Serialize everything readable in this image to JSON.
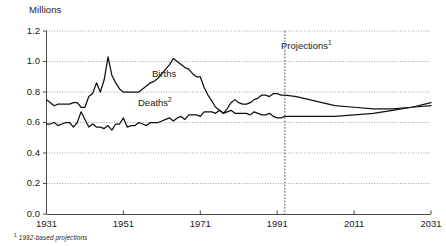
{
  "chart_data": {
    "type": "line",
    "title": "",
    "ylabel": "Millions",
    "xlabel": "",
    "ylim": [
      0.0,
      1.2
    ],
    "xlim": [
      1931,
      2031
    ],
    "yticks": [
      "0.0",
      "0.2",
      "0.4",
      "0.6",
      "0.8",
      "1.0",
      "1.2"
    ],
    "ytick_values": [
      0.0,
      0.2,
      0.4,
      0.6,
      0.8,
      1.0,
      1.2
    ],
    "xticks": [
      "1931",
      "1951",
      "1971",
      "1991",
      "2011",
      "2031"
    ],
    "xtick_values": [
      1931,
      1951,
      1971,
      1991,
      2011,
      2031
    ],
    "grid": "horizontal-dotted",
    "legend": "inline-labels",
    "annotations": [
      {
        "name": "projections-divider",
        "text": "Projections",
        "superscript": "1",
        "x": 1993,
        "style": "vertical-dotted-line"
      }
    ],
    "footnote": {
      "marker": "1",
      "text": "1992-based projections"
    },
    "series": [
      {
        "name": "Births",
        "label": "Births",
        "x": [
          1931,
          1932,
          1933,
          1934,
          1935,
          1936,
          1937,
          1938,
          1939,
          1940,
          1941,
          1942,
          1943,
          1944,
          1945,
          1946,
          1947,
          1948,
          1949,
          1950,
          1951,
          1952,
          1953,
          1954,
          1955,
          1956,
          1957,
          1958,
          1959,
          1960,
          1961,
          1962,
          1963,
          1964,
          1965,
          1966,
          1967,
          1968,
          1969,
          1970,
          1971,
          1972,
          1973,
          1974,
          1975,
          1976,
          1977,
          1978,
          1979,
          1980,
          1981,
          1982,
          1983,
          1984,
          1985,
          1986,
          1987,
          1988,
          1989,
          1990,
          1991,
          1992,
          1993,
          1996,
          2001,
          2006,
          2011,
          2016,
          2021,
          2026,
          2031
        ],
        "values": [
          0.75,
          0.73,
          0.71,
          0.72,
          0.72,
          0.72,
          0.72,
          0.73,
          0.73,
          0.7,
          0.7,
          0.77,
          0.79,
          0.86,
          0.8,
          0.88,
          1.03,
          0.91,
          0.86,
          0.82,
          0.8,
          0.8,
          0.8,
          0.8,
          0.8,
          0.82,
          0.84,
          0.86,
          0.87,
          0.89,
          0.92,
          0.95,
          0.98,
          1.02,
          1.0,
          0.98,
          0.96,
          0.95,
          0.92,
          0.9,
          0.9,
          0.83,
          0.78,
          0.74,
          0.7,
          0.68,
          0.66,
          0.69,
          0.73,
          0.75,
          0.73,
          0.72,
          0.72,
          0.73,
          0.75,
          0.76,
          0.78,
          0.78,
          0.77,
          0.79,
          0.79,
          0.78,
          0.78,
          0.77,
          0.74,
          0.71,
          0.7,
          0.69,
          0.69,
          0.7,
          0.71
        ]
      },
      {
        "name": "Deaths",
        "label": "Deaths",
        "superscript": "2",
        "x": [
          1931,
          1932,
          1933,
          1934,
          1935,
          1936,
          1937,
          1938,
          1939,
          1940,
          1941,
          1942,
          1943,
          1944,
          1945,
          1946,
          1947,
          1948,
          1949,
          1950,
          1951,
          1952,
          1953,
          1954,
          1955,
          1956,
          1957,
          1958,
          1959,
          1960,
          1961,
          1962,
          1963,
          1964,
          1965,
          1966,
          1967,
          1968,
          1969,
          1970,
          1971,
          1972,
          1973,
          1974,
          1975,
          1976,
          1977,
          1978,
          1979,
          1980,
          1981,
          1982,
          1983,
          1984,
          1985,
          1986,
          1987,
          1988,
          1989,
          1990,
          1991,
          1992,
          1993,
          1996,
          2001,
          2006,
          2011,
          2016,
          2021,
          2026,
          2031
        ],
        "values": [
          0.59,
          0.59,
          0.6,
          0.58,
          0.59,
          0.6,
          0.6,
          0.57,
          0.6,
          0.67,
          0.62,
          0.57,
          0.59,
          0.57,
          0.57,
          0.56,
          0.58,
          0.55,
          0.59,
          0.59,
          0.63,
          0.57,
          0.58,
          0.58,
          0.6,
          0.59,
          0.58,
          0.6,
          0.6,
          0.6,
          0.61,
          0.62,
          0.63,
          0.61,
          0.63,
          0.64,
          0.62,
          0.65,
          0.65,
          0.65,
          0.64,
          0.67,
          0.67,
          0.67,
          0.66,
          0.68,
          0.66,
          0.67,
          0.68,
          0.66,
          0.66,
          0.66,
          0.66,
          0.65,
          0.67,
          0.66,
          0.65,
          0.65,
          0.66,
          0.64,
          0.63,
          0.63,
          0.64,
          0.64,
          0.64,
          0.64,
          0.65,
          0.66,
          0.68,
          0.7,
          0.73
        ]
      }
    ]
  }
}
